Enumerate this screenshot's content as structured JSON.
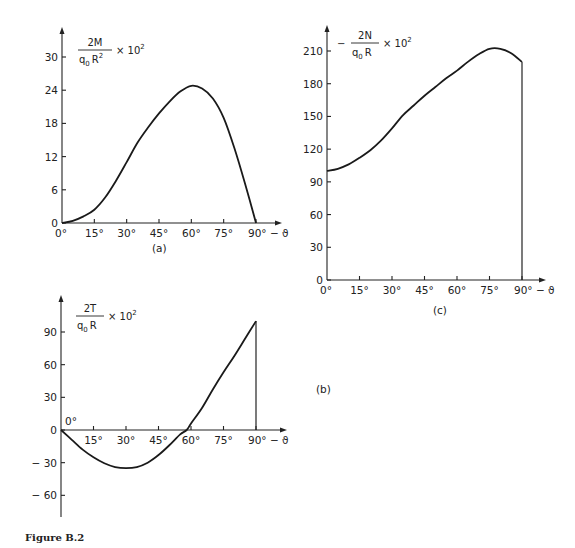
{
  "figure_caption": "Figure B.2",
  "chart_data": [
    {
      "id": "a",
      "panel_label": "(a)",
      "type": "line",
      "title": "",
      "ylabel": {
        "prefix": "",
        "numerator": "2M",
        "denominator_base": "q",
        "denominator_sub": "0",
        "denominator_rest": "R",
        "denominator_sup": "2",
        "suffix": "× 10",
        "suffix_sup": "2"
      },
      "xlabel": "ϑ",
      "x_ticks": [
        0,
        15,
        30,
        45,
        60,
        75,
        90
      ],
      "x_tick_labels": [
        "0°",
        "15°",
        "30°",
        "45°",
        "60°",
        "75°",
        "90° − ϑ"
      ],
      "y_ticks": [
        0,
        6,
        12,
        18,
        24,
        30
      ],
      "y_tick_labels": [
        "0",
        "6",
        "12",
        "18",
        "24",
        "30"
      ],
      "xlim": [
        0,
        90
      ],
      "ylim": [
        0,
        35
      ],
      "grid": false,
      "end_vertical_line": false,
      "x": [
        0,
        5,
        10,
        15,
        20,
        25,
        30,
        35,
        40,
        45,
        50,
        55,
        60,
        65,
        70,
        75,
        80,
        85,
        90
      ],
      "y": [
        0,
        0.4,
        1.2,
        2.4,
        4.6,
        7.6,
        11.0,
        14.5,
        17.3,
        19.8,
        22.0,
        23.8,
        24.8,
        24.3,
        22.5,
        19.0,
        13.5,
        7.0,
        0
      ]
    },
    {
      "id": "b",
      "panel_label": "(b)",
      "type": "line",
      "title": "",
      "ylabel": {
        "prefix": "",
        "numerator": "2T",
        "denominator_base": "q",
        "denominator_sub": "0",
        "denominator_rest": "R",
        "denominator_sup": "",
        "suffix": "× 10",
        "suffix_sup": "2"
      },
      "xlabel": "ϑ",
      "x_ticks": [
        0,
        15,
        30,
        45,
        60,
        75,
        90
      ],
      "x_tick_labels": [
        "0°",
        "15°",
        "30°",
        "45°",
        "60°",
        "75°",
        "90° − ϑ"
      ],
      "y_ticks": [
        -60,
        -30,
        0,
        30,
        60,
        90
      ],
      "y_tick_labels": [
        "− 60",
        "− 30",
        "0",
        "30",
        "60",
        "90"
      ],
      "xlim": [
        0,
        90
      ],
      "ylim": [
        -68,
        108
      ],
      "grid": false,
      "end_vertical_line": true,
      "x": [
        0,
        5,
        10,
        15,
        20,
        25,
        30,
        35,
        40,
        45,
        50,
        55,
        58,
        60,
        65,
        70,
        75,
        80,
        85,
        90
      ],
      "y": [
        0,
        -9,
        -18,
        -25,
        -30.5,
        -34,
        -35,
        -34,
        -30,
        -23,
        -14,
        -4,
        0,
        6,
        20,
        37,
        53,
        68,
        84,
        100
      ]
    },
    {
      "id": "c",
      "panel_label": "(c)",
      "type": "line",
      "title": "",
      "ylabel": {
        "prefix": "−",
        "numerator": "2N",
        "denominator_base": "q",
        "denominator_sub": "0",
        "denominator_rest": "R",
        "denominator_sup": "",
        "suffix": "× 10",
        "suffix_sup": "2"
      },
      "xlabel": "ϑ",
      "x_ticks": [
        0,
        15,
        30,
        45,
        60,
        75,
        90
      ],
      "x_tick_labels": [
        "0°",
        "15°",
        "30°",
        "45°",
        "60°",
        "75°",
        "90° − ϑ"
      ],
      "y_ticks": [
        0,
        30,
        60,
        90,
        120,
        150,
        180,
        210
      ],
      "y_tick_labels": [
        "0",
        "30",
        "60",
        "90",
        "120",
        "150",
        "180",
        "210"
      ],
      "xlim": [
        0,
        90
      ],
      "ylim": [
        0,
        232
      ],
      "grid": false,
      "end_vertical_line": true,
      "x": [
        0,
        5,
        10,
        15,
        20,
        25,
        30,
        35,
        40,
        45,
        50,
        55,
        60,
        65,
        70,
        75,
        80,
        85,
        90
      ],
      "y": [
        100,
        102,
        106,
        112,
        119,
        128,
        139,
        151,
        160,
        169,
        177,
        185,
        192,
        200,
        207,
        212,
        212,
        208,
        200
      ]
    }
  ]
}
